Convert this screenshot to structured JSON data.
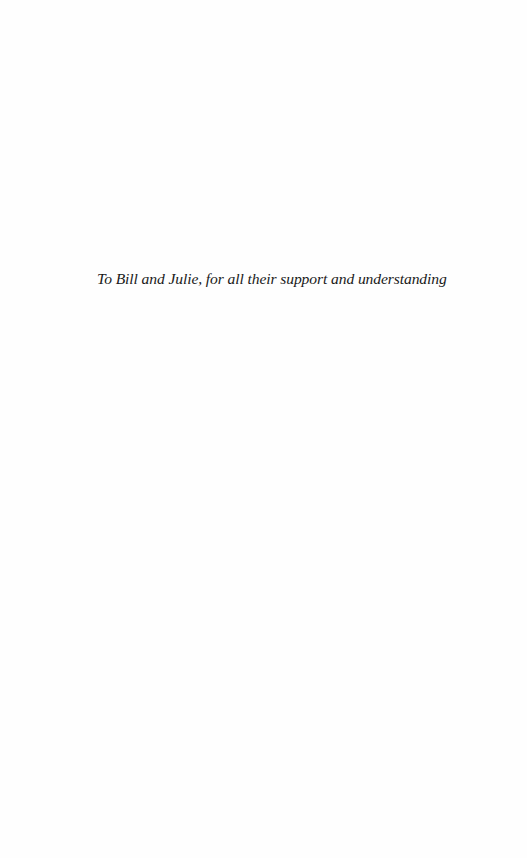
{
  "page": {
    "type": "dedication",
    "background_color": "#fefefe",
    "text_color": "#1a1a1a"
  },
  "dedication": {
    "text": "To Bill and Julie, for all their support and understanding"
  }
}
